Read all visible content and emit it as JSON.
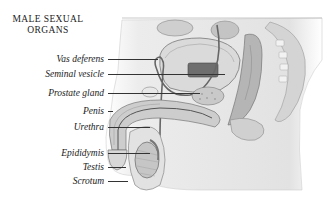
{
  "title": {
    "line1": "MALE SEXUAL",
    "line2": "ORGANS"
  },
  "labels": [
    {
      "text": "Vas deferens",
      "y": 59,
      "line_x1": 108,
      "line_x2": 158
    },
    {
      "text": "Seminal vesicle",
      "y": 74,
      "line_x1": 108,
      "line_x2": 225
    },
    {
      "text": "Prostate gland",
      "y": 93,
      "line_x1": 108,
      "line_x2": 200
    },
    {
      "text": "Penis",
      "y": 111,
      "line_x1": 108,
      "line_x2": 100
    },
    {
      "text": "Urethra",
      "y": 127,
      "line_x1": 108,
      "line_x2": 150
    },
    {
      "text": "Epididymis",
      "y": 153,
      "line_x1": 108,
      "line_x2": 150
    },
    {
      "text": "Testis",
      "y": 167,
      "line_x1": 108,
      "line_x2": 126
    },
    {
      "text": "Scrotum",
      "y": 181,
      "line_x1": 108,
      "line_x2": 128
    }
  ],
  "colors": {
    "ink": "#1a1a1a",
    "tissue_light": "#e6e6e6",
    "tissue_mid": "#bdbdbd",
    "tissue_dark": "#7a7a7a"
  }
}
